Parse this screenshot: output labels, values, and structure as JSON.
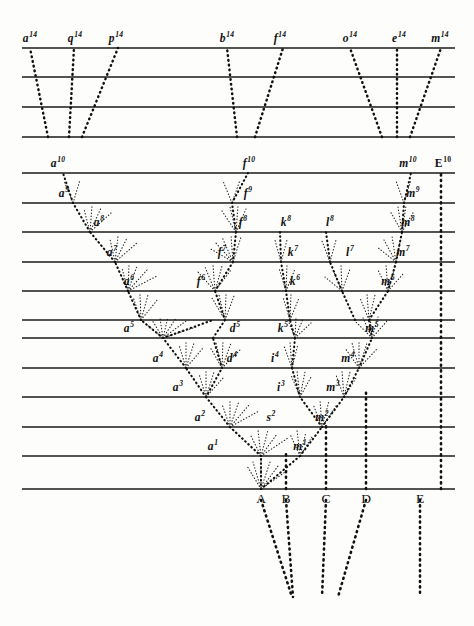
{
  "figure": {
    "line_color": "#1a1a1a",
    "dot_color": "#111111",
    "background": "#fdfdfb",
    "width": 474,
    "height": 626
  },
  "bands": {
    "upper_lines_y": [
      48,
      77,
      107,
      137
    ],
    "main_lines_y": [
      173,
      203,
      232,
      262,
      291,
      320,
      338,
      368,
      397,
      427,
      456,
      489
    ],
    "all_lines_y": [
      48,
      77,
      107,
      137,
      173,
      203,
      232,
      262,
      291,
      320,
      338,
      368,
      397,
      427,
      456,
      489
    ]
  },
  "top_labels": [
    {
      "name": "a",
      "sup": "14",
      "x": 30,
      "y": 44
    },
    {
      "name": "q",
      "sup": "14",
      "x": 75,
      "y": 44
    },
    {
      "name": "p",
      "sup": "14",
      "x": 116,
      "y": 44
    },
    {
      "name": "b",
      "sup": "14",
      "x": 227,
      "y": 44
    },
    {
      "name": "f",
      "sup": "14",
      "x": 280,
      "y": 44
    },
    {
      "name": "o",
      "sup": "14",
      "x": 350,
      "y": 44
    },
    {
      "name": "e",
      "sup": "14",
      "x": 399,
      "y": 44
    },
    {
      "name": "m",
      "sup": "14",
      "x": 440,
      "y": 44
    }
  ],
  "tenth_labels": [
    {
      "name": "a",
      "sup": "10",
      "x": 58,
      "y": 169,
      "roman": false
    },
    {
      "name": "f",
      "sup": "10",
      "x": 249,
      "y": 169,
      "roman": false
    },
    {
      "name": "m",
      "sup": "10",
      "x": 408,
      "y": 169,
      "roman": false
    },
    {
      "name": "E",
      "sup": "10",
      "x": 443,
      "y": 169,
      "roman": true
    }
  ],
  "node_labels": [
    {
      "name": "a",
      "sup": "9",
      "x": 64,
      "y": 199
    },
    {
      "name": "f",
      "sup": "9",
      "x": 248,
      "y": 199
    },
    {
      "name": "m",
      "sup": "9",
      "x": 413,
      "y": 199
    },
    {
      "name": "a",
      "sup": "8",
      "x": 99,
      "y": 228
    },
    {
      "name": "f",
      "sup": "8",
      "x": 243,
      "y": 228
    },
    {
      "name": "k",
      "sup": "8",
      "x": 286,
      "y": 228
    },
    {
      "name": "l",
      "sup": "8",
      "x": 330,
      "y": 228
    },
    {
      "name": "m",
      "sup": "8",
      "x": 408,
      "y": 228
    },
    {
      "name": "a",
      "sup": "7",
      "x": 112,
      "y": 258
    },
    {
      "name": "f",
      "sup": "7",
      "x": 222,
      "y": 258
    },
    {
      "name": "k",
      "sup": "7",
      "x": 293,
      "y": 258
    },
    {
      "name": "l",
      "sup": "7",
      "x": 350,
      "y": 258
    },
    {
      "name": "m",
      "sup": "7",
      "x": 403,
      "y": 258
    },
    {
      "name": "a",
      "sup": "6",
      "x": 129,
      "y": 287
    },
    {
      "name": "f",
      "sup": "6",
      "x": 201,
      "y": 287
    },
    {
      "name": "k",
      "sup": "6",
      "x": 295,
      "y": 287
    },
    {
      "name": "m",
      "sup": "6",
      "x": 388,
      "y": 287
    },
    {
      "name": "a",
      "sup": "5",
      "x": 129,
      "y": 334
    },
    {
      "name": "d",
      "sup": "5",
      "x": 235,
      "y": 334
    },
    {
      "name": "k",
      "sup": "5",
      "x": 283,
      "y": 334
    },
    {
      "name": "m",
      "sup": "5",
      "x": 372,
      "y": 334
    },
    {
      "name": "a",
      "sup": "4",
      "x": 158,
      "y": 364
    },
    {
      "name": "d",
      "sup": "4",
      "x": 232,
      "y": 364
    },
    {
      "name": "i",
      "sup": "4",
      "x": 275,
      "y": 364
    },
    {
      "name": "m",
      "sup": "4",
      "x": 348,
      "y": 364
    },
    {
      "name": "a",
      "sup": "3",
      "x": 178,
      "y": 393
    },
    {
      "name": "i",
      "sup": "3",
      "x": 281,
      "y": 393
    },
    {
      "name": "m",
      "sup": "3",
      "x": 333,
      "y": 393
    },
    {
      "name": "a",
      "sup": "2",
      "x": 200,
      "y": 423
    },
    {
      "name": "s",
      "sup": "2",
      "x": 271,
      "y": 423
    },
    {
      "name": "m",
      "sup": "2",
      "x": 322,
      "y": 423
    },
    {
      "name": "a",
      "sup": "1",
      "x": 213,
      "y": 452
    },
    {
      "name": "m",
      "sup": "1",
      "x": 300,
      "y": 452
    }
  ],
  "genus_labels": [
    {
      "text": "A",
      "x": 261,
      "y": 492
    },
    {
      "text": "B",
      "x": 286,
      "y": 492
    },
    {
      "text": "C",
      "x": 326,
      "y": 492
    },
    {
      "text": "D",
      "x": 366,
      "y": 492
    },
    {
      "text": "E",
      "x": 420,
      "y": 492
    }
  ],
  "chart_data": {
    "type": "diagram",
    "n_generation_lines": 16,
    "base_species": [
      "A",
      "B",
      "C",
      "D",
      "E"
    ],
    "surviving_lineages_top": [
      "a14",
      "q14",
      "p14",
      "b14",
      "f14",
      "o14",
      "e14",
      "m14"
    ],
    "lineage_roots": [
      "a",
      "f",
      "m",
      "E"
    ],
    "generations_labelled": [
      1,
      2,
      3,
      4,
      5,
      6,
      7,
      8,
      9,
      10,
      14
    ]
  }
}
